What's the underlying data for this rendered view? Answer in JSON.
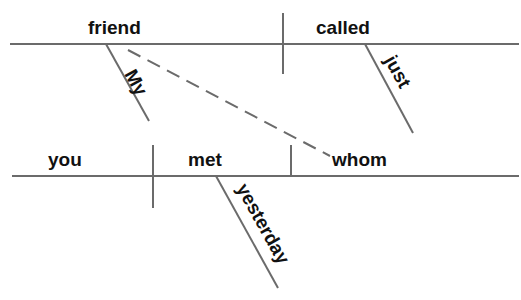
{
  "diagram": {
    "sentence": "My friend whom you met yesterday just called",
    "colors": {
      "line": "#6b6b6b",
      "text": "#111111",
      "background": "#ffffff"
    },
    "main_clause": {
      "subject": "friend",
      "verb": "called",
      "modifiers": {
        "subject_modifier": "My",
        "verb_modifier": "just"
      }
    },
    "relative_clause": {
      "subject": "you",
      "verb": "met",
      "object": "whom",
      "modifiers": {
        "verb_modifier": "yesterday"
      }
    },
    "connector": {
      "type": "dashed",
      "from": "friend",
      "to": "whom"
    }
  }
}
